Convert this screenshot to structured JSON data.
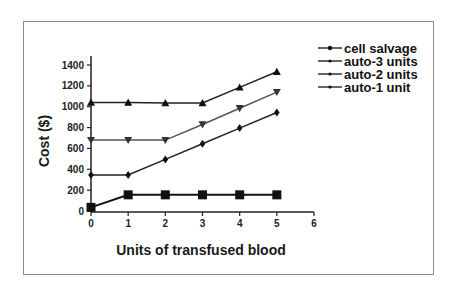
{
  "chart_data": {
    "type": "line",
    "title": "",
    "xlabel": "Units of transfused blood",
    "ylabel": "Cost ($)",
    "x": [
      0,
      1,
      2,
      3,
      4,
      5
    ],
    "xlim": [
      0,
      6
    ],
    "ylim": [
      0,
      1400
    ],
    "xticks": [
      "0",
      "1",
      "2",
      "3",
      "4",
      "5",
      "6"
    ],
    "yticks": [
      "0",
      "200",
      "400",
      "600",
      "800",
      "1000",
      "1200",
      "1400"
    ],
    "grid": false,
    "legend_position": "upper right (outside plot)",
    "series": [
      {
        "name": "cell salvage",
        "marker": "square",
        "values": [
          35,
          155,
          155,
          155,
          155,
          155
        ]
      },
      {
        "name": "auto-3 units",
        "marker": "triangle-up",
        "values": [
          1040,
          1040,
          1035,
          1035,
          1185,
          1335
        ]
      },
      {
        "name": "auto-2 units",
        "marker": "triangle-down",
        "values": [
          680,
          680,
          680,
          830,
          985,
          1140
        ]
      },
      {
        "name": "auto-1 unit",
        "marker": "diamond",
        "values": [
          345,
          345,
          495,
          645,
          795,
          945
        ]
      }
    ]
  },
  "legend": {
    "items": [
      "cell salvage",
      "auto-3 units",
      "auto-2 units",
      "auto-1 unit"
    ]
  }
}
